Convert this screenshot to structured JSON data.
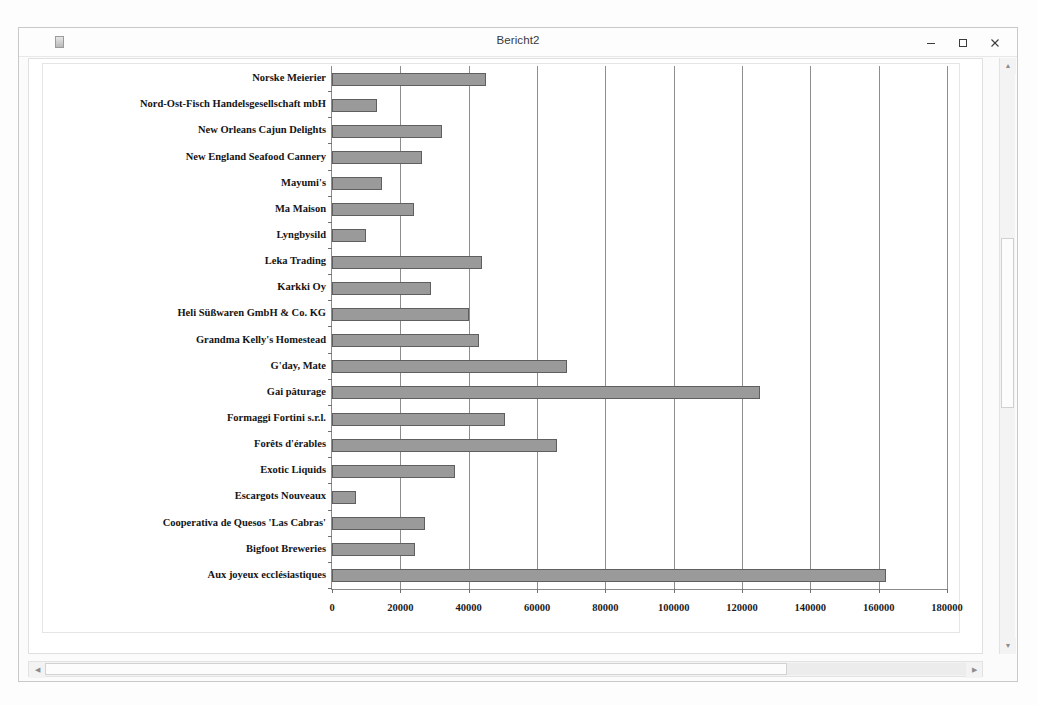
{
  "window": {
    "title": "Bericht2",
    "icon": "report-window-icon",
    "buttons": {
      "minimize": "minimize-icon",
      "maximize": "maximize-icon",
      "close": "close-icon"
    }
  },
  "scrollbars": {
    "vertical": {
      "up": "▲",
      "down": "▼"
    },
    "horizontal": {
      "left": "◀",
      "right": "▶"
    }
  },
  "colors": {
    "bar_fill": "#9a9a9a",
    "bar_border": "#5f5f5f",
    "gridline": "#8d8d8d",
    "axis": "#8b8b8b",
    "plot_background": "#ffffff"
  },
  "chart_data": {
    "type": "bar",
    "orientation": "horizontal",
    "title": "",
    "xlabel": "",
    "ylabel": "",
    "xlim": [
      0,
      180000
    ],
    "xticks": [
      0,
      20000,
      40000,
      60000,
      80000,
      100000,
      120000,
      140000,
      160000,
      180000
    ],
    "xtick_labels": [
      "0",
      "20000",
      "40000",
      "60000",
      "80000",
      "100000",
      "120000",
      "140000",
      "160000",
      "180000"
    ],
    "grid": true,
    "legend": false,
    "categories": [
      "Norske Meierier",
      "Nord-Ost-Fisch Handelsgesellschaft mbH",
      "New Orleans Cajun Delights",
      "New England Seafood Cannery",
      "Mayumi's",
      "Ma Maison",
      "Lyngbysild",
      "Leka Trading",
      "Karkki Oy",
      "Heli Süßwaren GmbH & Co. KG",
      "Grandma Kelly's Homestead",
      "G'day, Mate",
      "Gai pâturage",
      "Formaggi Fortini s.r.l.",
      "Forêts d'érables",
      "Exotic Liquids",
      "Escargots Nouveaux",
      "Cooperativa de Quesos 'Las Cabras'",
      "Bigfoot Breweries",
      "Aux joyeux ecclésiastiques"
    ],
    "values": [
      45000,
      13200,
      32200,
      26400,
      14600,
      24000,
      10000,
      43900,
      29000,
      40100,
      43000,
      68800,
      125300,
      50600,
      65900,
      36000,
      7000,
      27200,
      24300,
      162200
    ]
  }
}
